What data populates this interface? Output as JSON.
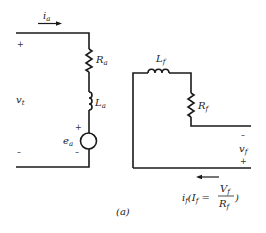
{
  "figure": {
    "caption": "(a)"
  },
  "armature_circuit": {
    "current_label": "i",
    "current_sub": "a",
    "terminal_voltage_label": "v",
    "terminal_voltage_sub": "t",
    "plus_sign": "+",
    "minus_sign": "–",
    "resistor_label": "R",
    "resistor_sub": "a",
    "inductor_label": "L",
    "inductor_sub": "a",
    "emf_label": "e",
    "emf_sub": "a",
    "emf_plus": "+",
    "emf_minus": "–"
  },
  "field_circuit": {
    "inductor_label": "L",
    "inductor_sub": "f",
    "resistor_label": "R",
    "resistor_sub": "f",
    "voltage_label": "v",
    "voltage_sub": "f",
    "voltage_minus": "–",
    "voltage_plus": "+",
    "current_label": "i",
    "current_sub": "f",
    "current_expr_open": "(I",
    "current_expr_sub": "f",
    "current_expr_eq": " =",
    "fraction_num": "V",
    "fraction_num_sub": "f",
    "fraction_den": "R",
    "fraction_den_sub": "f",
    "current_expr_close": ")"
  },
  "colors": {
    "line": "#1a1a1a",
    "background": "#ffffff"
  }
}
